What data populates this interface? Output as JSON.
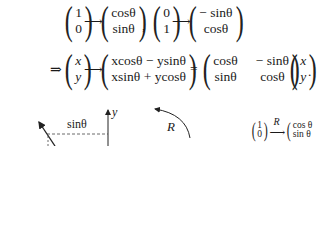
{
  "row1": {
    "e1": [
      "1",
      "0"
    ],
    "img1": [
      "cosθ",
      "sinθ"
    ],
    "separator": ",",
    "e2": [
      "0",
      "1"
    ],
    "img2": [
      "− sinθ",
      "cosθ"
    ],
    "arrow": "⟶"
  },
  "row2": {
    "implies": "⇒",
    "vec": [
      "x",
      "y"
    ],
    "arrow": "⟶",
    "result": [
      "xcosθ − ysinθ",
      "xsinθ + ycosθ"
    ],
    "equals": "=",
    "matrix": [
      [
        "cosθ",
        "− sinθ"
      ],
      [
        "sinθ",
        "cosθ"
      ]
    ],
    "vec2": [
      "x",
      "y"
    ],
    "period": "."
  },
  "figure": {
    "sin_label": "sinθ",
    "y_axis_label": "y",
    "rotation_label": "R",
    "mapping": {
      "source": [
        "1",
        "0"
      ],
      "arrow_label": "R",
      "target": [
        "cos θ",
        "sin θ"
      ]
    }
  }
}
